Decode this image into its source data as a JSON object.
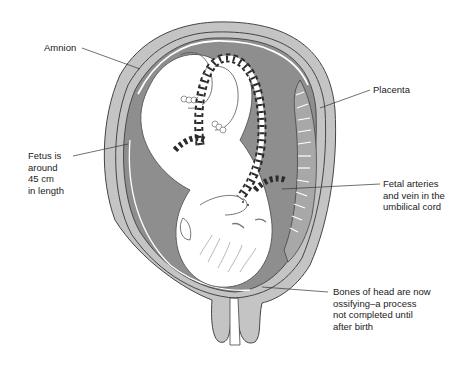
{
  "diagram": {
    "labels": {
      "amnion": "Amnion",
      "placenta": "Placenta",
      "fetus": "Fetus is\naround\n45 cm\nin length",
      "umbilical": "Fetal arteries\nand vein in the\numbilical cord",
      "bones": "Bones of head are now\nossifying–a process\nnot completed until\nafter birth"
    },
    "colors": {
      "uterus_wall": "#c4c4c4",
      "amniotic_fluid": "#8e8e8e",
      "placenta": "#a8a8a8",
      "fetus": "#ffffff",
      "outline": "#444444",
      "cord_stripe": "#2b2b2b"
    }
  }
}
